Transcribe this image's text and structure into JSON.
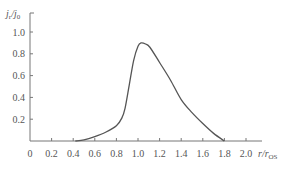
{
  "chart_data": {
    "type": "line",
    "title": "",
    "xlabel": "r/r_OS",
    "ylabel": "j_r/j_0",
    "xlabel_parts": {
      "main": "r/r",
      "sub": "OS"
    },
    "ylabel_parts": {
      "j1": "j",
      "sub1": "r",
      "slash": "/j",
      "sub2": "0"
    },
    "xlim": [
      0,
      2.0
    ],
    "ylim": [
      0,
      1.0
    ],
    "x_ticks": [
      0,
      0.2,
      0.4,
      0.6,
      0.8,
      1.0,
      1.2,
      1.4,
      1.6,
      1.8,
      2.0
    ],
    "x_tick_labels": [
      "0",
      "0.2",
      "0.4",
      "0.6",
      "0.8",
      "1.0",
      "1.2",
      "1.4",
      "1.6",
      "1.8",
      "2.0"
    ],
    "y_ticks": [
      0.2,
      0.4,
      0.6,
      0.8,
      1.0
    ],
    "y_tick_labels": [
      "0.2",
      "0.4",
      "0.6",
      "0.8",
      "1.0"
    ],
    "grid": false,
    "legend": null,
    "series": [
      {
        "name": "j_r/j_0",
        "color": "#555555",
        "x": [
          0.42,
          0.5,
          0.6,
          0.7,
          0.8,
          0.85,
          0.88,
          0.92,
          0.96,
          1.0,
          1.03,
          1.07,
          1.11,
          1.2,
          1.3,
          1.4,
          1.5,
          1.6,
          1.7,
          1.8
        ],
        "y": [
          0.0,
          0.01,
          0.04,
          0.08,
          0.14,
          0.21,
          0.3,
          0.52,
          0.74,
          0.87,
          0.9,
          0.89,
          0.86,
          0.72,
          0.56,
          0.38,
          0.26,
          0.16,
          0.07,
          0.0
        ]
      }
    ]
  }
}
